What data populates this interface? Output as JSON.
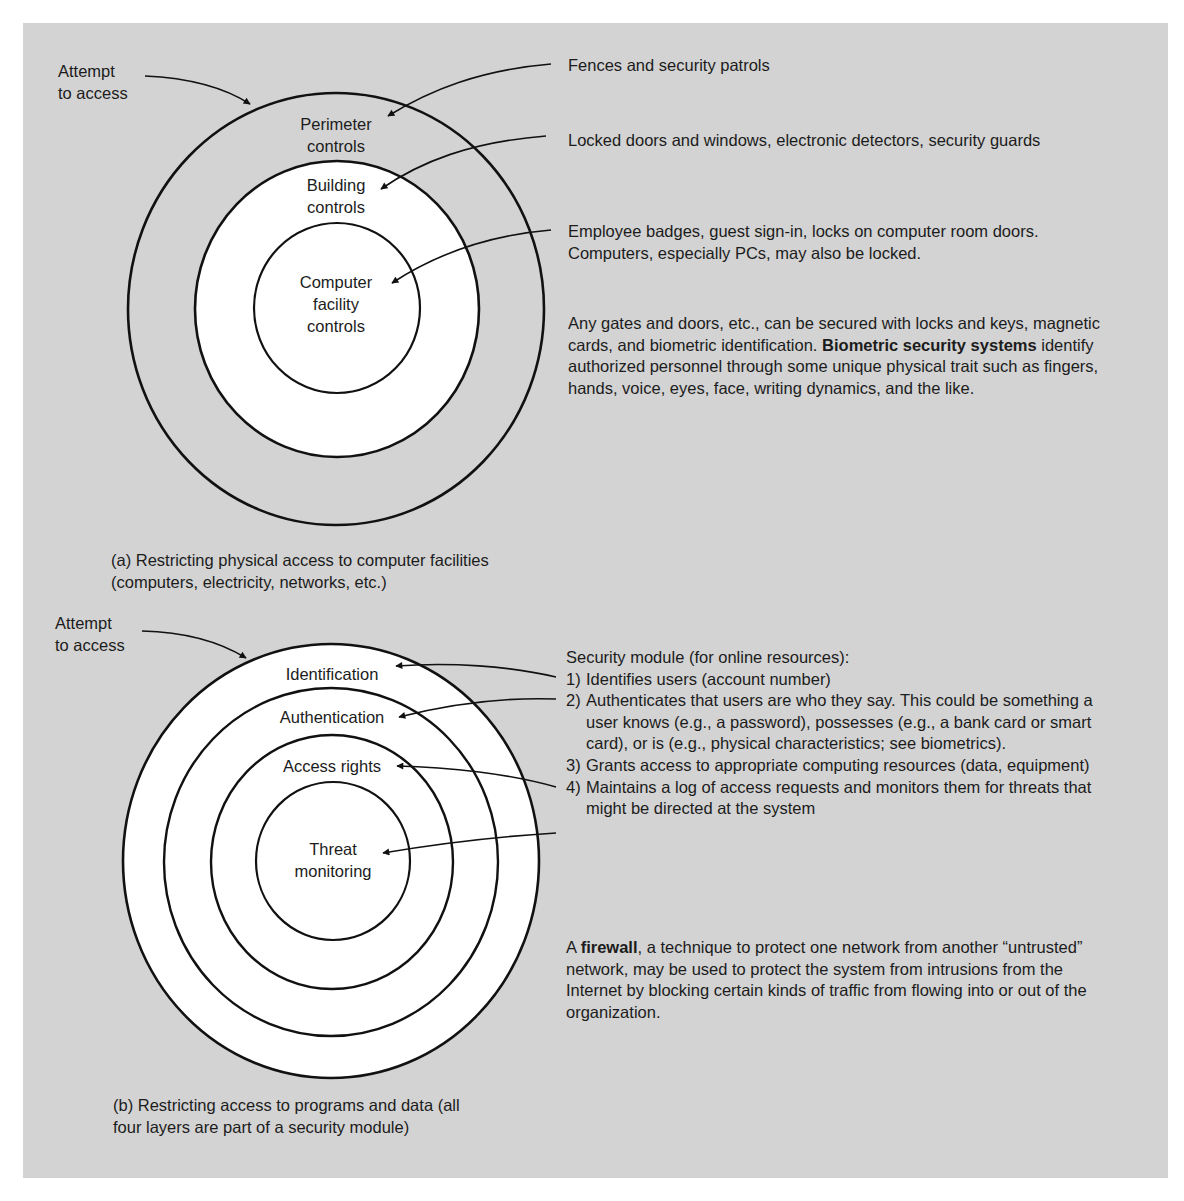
{
  "panel": {
    "background": "#d3d3d3"
  },
  "diagram_a": {
    "attempt_label": [
      "Attempt",
      "to access"
    ],
    "rings": [
      {
        "label": [
          "Perimeter",
          "controls"
        ],
        "fill": "#d3d3d3"
      },
      {
        "label": [
          "Building",
          "controls"
        ],
        "fill": "#ffffff"
      },
      {
        "label": [
          "Computer",
          "facility",
          "controls"
        ],
        "fill": "#ffffff"
      }
    ],
    "annotations": [
      {
        "text": "Fences and security patrols"
      },
      {
        "text": "Locked doors and windows, electronic detectors, security guards"
      },
      {
        "lines": [
          "Employee badges, guest sign-in, locks on computer room doors.",
          "Computers, especially PCs, may also be locked."
        ]
      }
    ],
    "paragraph": {
      "part1": "Any gates and doors, etc., can be secured with locks and keys, magnetic cards, and biometric identification. ",
      "bold": "Biometric security systems",
      "part2": " identify authorized personnel through some unique physical trait such as fingers, hands, voice, eyes, face, writing dynamics, and the like."
    },
    "caption": [
      "(a)  Restricting physical access to computer facilities",
      "(computers, electricity, networks, etc.)"
    ]
  },
  "diagram_b": {
    "attempt_label": [
      "Attempt",
      "to access"
    ],
    "rings": [
      {
        "label": [
          "Identification"
        ]
      },
      {
        "label": [
          "Authentication"
        ]
      },
      {
        "label": [
          "Access rights"
        ]
      },
      {
        "label": [
          "Threat",
          "monitoring"
        ]
      }
    ],
    "list_title": "Security module (for online resources):",
    "list": [
      {
        "num": "1)",
        "text": "Identifies users (account number)"
      },
      {
        "num": "2)",
        "text": "Authenticates that users are who they say. This could be something a user knows (e.g., a password), possesses (e.g., a bank card or smart card), or is (e.g., physical characteristics; see biometrics)."
      },
      {
        "num": "3)",
        "text": "Grants access to appropriate computing resources (data, equipment)"
      },
      {
        "num": "4)",
        "text": "Maintains a log of access requests and monitors them for threats that might be directed at the system"
      }
    ],
    "paragraph": {
      "part1": "A ",
      "bold": "firewall",
      "part2": ", a technique to protect one network from another “untrusted” network, may be used to protect the system from intrusions from the Internet by blocking certain kinds of traffic from flowing into or out of the organization."
    },
    "caption": [
      "(b)  Restricting access to programs and data (all",
      "four layers are part of a security module)"
    ]
  }
}
